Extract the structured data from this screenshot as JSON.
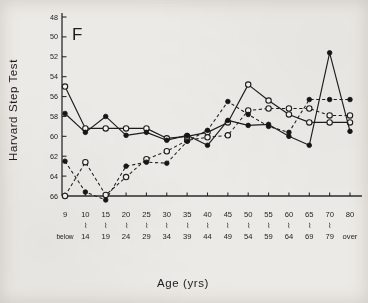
{
  "panel": {
    "label": "F"
  },
  "axes": {
    "ytitle": "Harvard  Step  Test",
    "xtitle": "Age (yrs)",
    "yticks": [
      48,
      50,
      52,
      54,
      56,
      58,
      60,
      62,
      64,
      66
    ],
    "xtick_top": [
      "9",
      "10",
      "15",
      "20",
      "25",
      "30",
      "35",
      "40",
      "45",
      "50",
      "55",
      "60",
      "65",
      "70",
      "80"
    ],
    "xtick_bottom": [
      "below",
      "14",
      "19",
      "24",
      "29",
      "34",
      "39",
      "44",
      "49",
      "54",
      "59",
      "64",
      "69",
      "79",
      "over"
    ],
    "xtick_tilde": [
      false,
      true,
      true,
      true,
      true,
      true,
      true,
      true,
      true,
      true,
      true,
      true,
      true,
      true,
      false
    ]
  },
  "chart_data": {
    "type": "line",
    "title": "F",
    "xlabel": "Age (yrs)",
    "ylabel": "Harvard Step Test",
    "ylim": [
      48,
      66
    ],
    "y_inverted": true,
    "grid": false,
    "legend": "none",
    "categories": [
      "9 below",
      "10-14",
      "15-19",
      "20-24",
      "25-29",
      "30-34",
      "35-39",
      "40-44",
      "45-49",
      "50-54",
      "55-59",
      "60-64",
      "65-69",
      "70-79",
      "80 over"
    ],
    "series": [
      {
        "name": "open-circle-solid",
        "marker": "open-circle",
        "linestyle": "solid",
        "values": [
          55.0,
          59.2,
          59.2,
          59.2,
          59.2,
          60.2,
          60.0,
          59.6,
          58.6,
          54.8,
          56.4,
          57.8,
          58.6,
          58.6,
          58.6
        ]
      },
      {
        "name": "filled-circle-solid",
        "marker": "filled-circle",
        "linestyle": "solid",
        "values": [
          57.7,
          59.6,
          58.0,
          59.9,
          59.6,
          60.4,
          59.9,
          60.9,
          58.4,
          58.9,
          58.8,
          60.0,
          60.9,
          51.6,
          59.5
        ]
      },
      {
        "name": "open-circle-dashed",
        "marker": "open-circle",
        "linestyle": "dashed",
        "values": [
          66.0,
          62.6,
          65.9,
          64.1,
          62.3,
          61.5,
          60.4,
          60.1,
          59.9,
          57.4,
          57.2,
          57.2,
          57.2,
          57.9,
          57.9
        ]
      },
      {
        "name": "filled-circle-dashed",
        "marker": "filled-circle",
        "linestyle": "dashed",
        "values": [
          62.5,
          65.6,
          66.4,
          63.0,
          62.6,
          62.7,
          60.5,
          59.4,
          56.5,
          57.8,
          59.0,
          59.6,
          56.3,
          56.3,
          56.3
        ]
      }
    ]
  }
}
